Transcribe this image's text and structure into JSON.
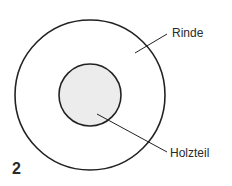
{
  "figure": {
    "number": "2",
    "labels": {
      "outer": "Rinde",
      "inner": "Holzteil"
    },
    "colors": {
      "stroke": "#222222",
      "inner_fill": "#ececec",
      "background": "#ffffff"
    }
  }
}
